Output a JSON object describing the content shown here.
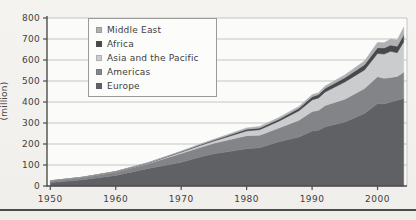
{
  "figure": {
    "y_axis_unit": "(million)",
    "x_tick_labels": [
      "1950",
      "1960",
      "1970",
      "1980",
      "1990",
      "2000"
    ],
    "y_tick_labels": [
      "0",
      "100",
      "200",
      "300",
      "400",
      "500",
      "600",
      "700",
      "800"
    ]
  },
  "colors": {
    "paper": "#f3f2ef",
    "plot_background": "#fbfbfa",
    "gridline": "#c6c5c2",
    "axis": "#4d4d4b",
    "tick_text": "#3f3f3d",
    "legend_border": "#9a9a98",
    "legend_background": "#fcfcfb"
  },
  "chart_data": {
    "type": "area",
    "stacked": true,
    "title": "",
    "xlabel": "",
    "ylabel": "(million)",
    "grid": "horizontal",
    "legend_position": "top-left-inside",
    "legend_order_top_to_bottom": [
      "Middle East",
      "Africa",
      "Asia and the Pacific",
      "Americas",
      "Europe"
    ],
    "xlim": [
      1950,
      2004
    ],
    "ylim": [
      0,
      800
    ],
    "x_ticks": [
      1950,
      1960,
      1970,
      1980,
      1990,
      2000
    ],
    "y_ticks": [
      0,
      100,
      200,
      300,
      400,
      500,
      600,
      700,
      800
    ],
    "x": [
      1950,
      1955,
      1960,
      1965,
      1970,
      1973,
      1975,
      1980,
      1982,
      1985,
      1988,
      1990,
      1991,
      1992,
      1995,
      1998,
      2000,
      2001,
      2002,
      2003,
      2004
    ],
    "series": [
      {
        "name": "Europe",
        "color": "#5f6164",
        "values": [
          16.8,
          30.0,
          50.4,
          83.7,
          113.0,
          139.0,
          153.9,
          177.3,
          182.0,
          212.0,
          233.0,
          261.5,
          265.4,
          282.0,
          304.1,
          345.0,
          392.5,
          390.8,
          399.8,
          408.6,
          416.4
        ]
      },
      {
        "name": "Americas",
        "color": "#828488",
        "values": [
          7.5,
          11.0,
          16.7,
          23.2,
          42.3,
          46.0,
          50.0,
          62.3,
          60.0,
          65.1,
          80.0,
          92.8,
          95.3,
          102.0,
          109.0,
          119.0,
          128.2,
          122.2,
          116.7,
          113.1,
          125.7
        ]
      },
      {
        "name": "Asia and the Pacific",
        "color": "#cbccce",
        "values": [
          0.2,
          0.5,
          0.9,
          2.1,
          6.2,
          9.0,
          10.2,
          23.0,
          26.0,
          32.9,
          45.0,
          55.8,
          58.7,
          64.0,
          82.0,
          89.0,
          110.1,
          115.3,
          124.9,
          113.2,
          144.2
        ]
      },
      {
        "name": "Africa",
        "color": "#47484b",
        "values": [
          0.5,
          0.7,
          0.8,
          1.4,
          2.4,
          4.0,
          4.7,
          7.2,
          8.0,
          9.7,
          12.5,
          15.0,
          16.2,
          17.0,
          20.2,
          24.5,
          27.9,
          28.9,
          29.5,
          30.7,
          33.4
        ]
      },
      {
        "name": "Middle East",
        "color": "#aeb0b3",
        "values": [
          0.2,
          0.4,
          0.6,
          2.4,
          1.9,
          3.0,
          3.5,
          7.1,
          7.5,
          7.5,
          8.5,
          9.6,
          8.5,
          11.0,
          13.7,
          18.0,
          24.9,
          25.0,
          29.2,
          30.0,
          36.3
        ]
      }
    ]
  }
}
